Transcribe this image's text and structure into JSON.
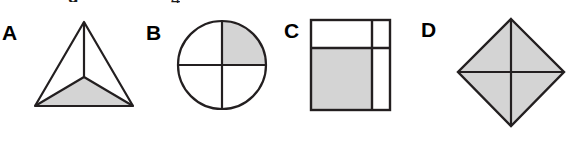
{
  "page": {
    "background_color": "#ffffff",
    "width": 572,
    "height": 150
  },
  "colors": {
    "shade_fill": "#d4d4d4",
    "stroke": "#231f20",
    "text": "#000000",
    "rule_line": "#4a4a4a",
    "background": "#ffffff"
  },
  "cropped_text": {
    "left_glyph": "g",
    "right_glyph": "4"
  },
  "labels": {
    "a": "A",
    "b": "B",
    "c": "C",
    "d": "D"
  },
  "shapes": [
    {
      "id": "shape-a",
      "label": "A",
      "type": "triangle",
      "name": "triangle-split-into-three-parts",
      "parts_total": 3,
      "parts_shaded": 1,
      "shaded_regions": [
        "bottom"
      ],
      "fraction_shaded": "1/3",
      "partition": "three segments drawn from an interior point to each vertex",
      "geometry": {
        "apex": [
          84,
          22
        ],
        "bottom_left": [
          35,
          106
        ],
        "bottom_right": [
          133,
          106
        ],
        "interior_point": [
          84,
          77
        ]
      }
    },
    {
      "id": "shape-b",
      "label": "B",
      "type": "circle",
      "name": "circle-split-into-quarters",
      "parts_total": 4,
      "parts_shaded": 1,
      "shaded_regions": [
        "upper-right"
      ],
      "fraction_shaded": "1/4",
      "partition": "one vertical diameter and one horizontal diameter",
      "geometry": {
        "center": [
          222,
          65
        ],
        "radius": 44
      }
    },
    {
      "id": "shape-c",
      "label": "C",
      "type": "square",
      "name": "square-split-into-three-rectangles",
      "parts_total": 3,
      "parts_shaded": 1,
      "shaded_regions": [
        "lower-left-large-rectangle"
      ],
      "fraction_shaded": "not equal parts",
      "partition": "one vertical line near the right edge and one horizontal line near the top edge",
      "geometry": {
        "left": 311,
        "top": 20,
        "right": 390,
        "bottom": 110,
        "vertical_divider_x": 372,
        "horizontal_divider_y": 48
      }
    },
    {
      "id": "shape-d",
      "label": "D",
      "type": "rhombus",
      "name": "diamond-split-into-four-triangles",
      "parts_total": 4,
      "parts_shaded": 4,
      "shaded_regions": [
        "top-left",
        "top-right",
        "bottom-left",
        "bottom-right"
      ],
      "fraction_shaded": "4/4",
      "partition": "both diagonals of the diamond",
      "geometry": {
        "top": [
          511,
          19
        ],
        "right": [
          564,
          72
        ],
        "bottom": [
          511,
          126
        ],
        "left": [
          458,
          72
        ]
      }
    }
  ],
  "rule": {
    "name": "bottom-horizontal-rule",
    "y": 137,
    "x_start": 300,
    "x_end": 572,
    "fades_in": true
  }
}
